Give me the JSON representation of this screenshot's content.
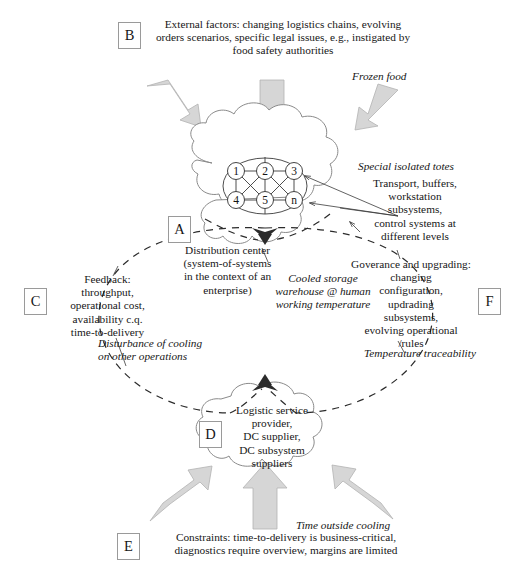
{
  "diagram": {
    "colors": {
      "arrow_fill": "#d4d4d4",
      "arrow_stroke": "#a8a8a8",
      "cloud_stroke": "#7e7e7e",
      "node_stroke": "#3a3a3a",
      "dashed_stroke": "#2b2b2b",
      "text": "#171717",
      "tag_border": "#9a9a9a"
    },
    "tags": {
      "a": "A",
      "b": "B",
      "c": "C",
      "d": "D",
      "e": "E",
      "f": "F"
    },
    "blocks": {
      "external_factors": "External factors: changing logistics chains, evolving\norders scenarios, specific legal issues, e.g., instigated by\nfood safety authorities",
      "frozen_food": "Frozen food",
      "special_isolated_totes": "Special isolated totes",
      "transport_buffers": "Transport, buffers,\nworkstation\nsubsystems,\ncontrol systems at\ndifferent levels",
      "distribution_center": "Distribution center\n(system-of-systems\nin the context of an\nenterprise)",
      "cooled_storage": "Cooled storage\nwarehouse @ human\nworking temperature",
      "feedback": "Feedback:\nthroughput,\noperational cost,\navailability c.q.\ntime-to-delivery",
      "disturbance": "Disturbance of cooling\non other operations",
      "governance": "Goverance and upgrading:\nchanging\nconfiguration,\nupdrading\nsubsystems,\nevolving operational\n/rules",
      "temperature_traceability": "Temperature traceability",
      "logistic_service": "Logistic service\nprovider,\nDC supplier,\nDC subsystem\nsuppliers",
      "time_outside_cooling": "Time outside cooling",
      "constraints": "Constraints: time-to-delivery is business-critical,\ndiagnostics require overview, margins are limited"
    },
    "network_nodes": [
      {
        "id": "n1",
        "label": "1",
        "x": 236,
        "y": 171
      },
      {
        "id": "n2",
        "label": "2",
        "x": 265,
        "y": 171
      },
      {
        "id": "n3",
        "label": "3",
        "x": 294,
        "y": 171
      },
      {
        "id": "n4",
        "label": "4",
        "x": 236,
        "y": 200
      },
      {
        "id": "n5",
        "label": "5",
        "x": 265,
        "y": 200
      },
      {
        "id": "nn",
        "label": "n",
        "x": 294,
        "y": 200
      }
    ],
    "network_edges": [
      [
        "n1",
        "n2"
      ],
      [
        "n2",
        "n3"
      ],
      [
        "n4",
        "n5"
      ],
      [
        "n5",
        "nn"
      ],
      [
        "n1",
        "n4"
      ],
      [
        "n2",
        "n5"
      ],
      [
        "n3",
        "nn"
      ],
      [
        "n1",
        "n5"
      ],
      [
        "n2",
        "n4"
      ],
      [
        "n2",
        "nn"
      ],
      [
        "n3",
        "n5"
      ]
    ],
    "arrows": [
      {
        "name": "arrow-external-left",
        "direction": "down-right"
      },
      {
        "name": "arrow-external-center",
        "direction": "down"
      },
      {
        "name": "arrow-frozen-food",
        "direction": "down-left"
      },
      {
        "name": "arrow-constraints-left",
        "direction": "up-right"
      },
      {
        "name": "arrow-constraints-center",
        "direction": "up"
      },
      {
        "name": "arrow-time-outside",
        "direction": "up-left"
      }
    ]
  }
}
